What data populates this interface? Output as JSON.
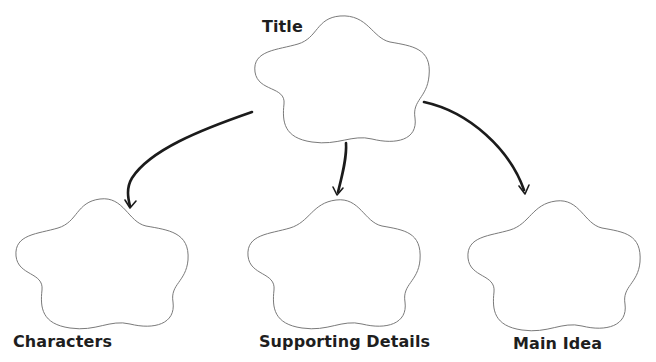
{
  "diagram": {
    "type": "graphic-organizer",
    "title_node": {
      "label": "Title"
    },
    "child_nodes": [
      {
        "label": "Characters"
      },
      {
        "label": "Supporting Details"
      },
      {
        "label": "Main Idea"
      }
    ],
    "edges": [
      {
        "from": "Title",
        "to": "Characters"
      },
      {
        "from": "Title",
        "to": "Supporting Details"
      },
      {
        "from": "Title",
        "to": "Main Idea"
      }
    ],
    "colors": {
      "background": "#ffffff",
      "shape_outline": "#7a7a7a",
      "arrow": "#1b1b1b",
      "text": "#1e1e1e"
    }
  }
}
